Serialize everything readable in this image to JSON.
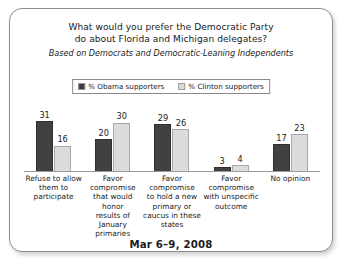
{
  "card": {
    "title_line1": "What would you prefer the Democratic Party",
    "title_line2": "do about Florida and Michigan delegates?",
    "subtitle": "Based on Democrats and Democratic-Leaning Independents",
    "footer_date": "Mar 6–9, 2008"
  },
  "legend": {
    "items": [
      {
        "label": "% Obama supporters",
        "color": "#3c3c3c",
        "swatch": "dark-swatch-icon"
      },
      {
        "label": "% Clinton supporters",
        "color": "#dcdcdc",
        "swatch": "light-swatch-icon"
      }
    ]
  },
  "chart_data": {
    "type": "bar",
    "title": "What would you prefer the Democratic Party do about Florida and Michigan delegates?",
    "subtitle": "Based on Democrats and Democratic-Leaning Independents",
    "xlabel": "",
    "ylabel": "",
    "ylim": [
      0,
      31
    ],
    "grid": false,
    "legend_position": "top-center",
    "annotation": "Mar 6–9, 2008",
    "categories": [
      "Refuse to allow them to participate",
      "Favor compromise that would honor results of January primaries",
      "Favor compromise to hold a new primary or caucus in these states",
      "Favor compromise with unspecific outcome",
      "No opinion"
    ],
    "category_lines": [
      [
        "Refuse to allow",
        "them to",
        "participate"
      ],
      [
        "Favor",
        "compromise",
        "that would honor",
        "results of January",
        "primaries"
      ],
      [
        "Favor",
        "compromise",
        "to hold a new",
        "primary or",
        "caucus in these",
        "states"
      ],
      [
        "Favor",
        "compromise",
        "with unspecific",
        "outcome"
      ],
      [
        "No opinion"
      ]
    ],
    "series": [
      {
        "name": "% Obama supporters",
        "color": "#3c3c3c",
        "values": [
          31,
          20,
          29,
          3,
          17
        ]
      },
      {
        "name": "% Clinton supporters",
        "color": "#dcdcdc",
        "values": [
          16,
          30,
          26,
          4,
          23
        ]
      }
    ]
  }
}
